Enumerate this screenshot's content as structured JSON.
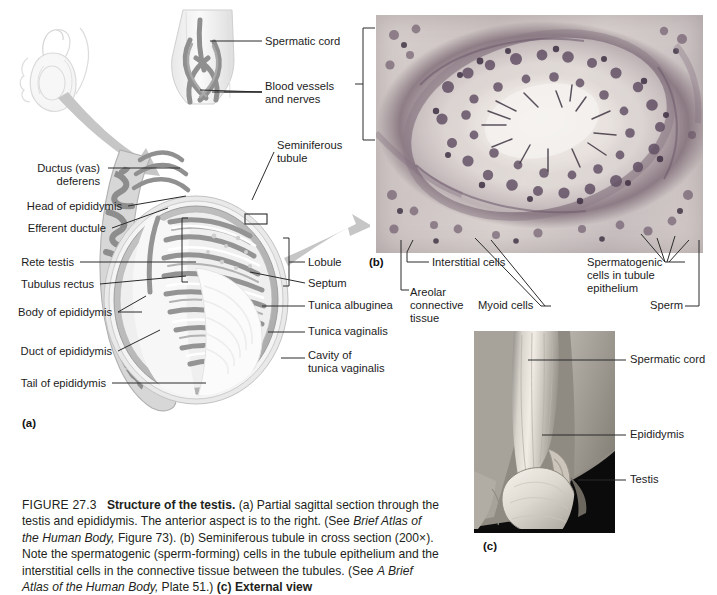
{
  "figure": {
    "number": "FIGURE 27.3",
    "title": "Structure of the testis.",
    "caption_a": "(a) Partial sagittal section through the testis and epididymis. The anterior aspect is to the right. (See",
    "caption_a_ital": "Brief Atlas of the Human Body,",
    "caption_a_tail": " Figure 73).",
    "caption_b": "(b) Seminiferous tubule in cross section (200×). Note the spermatogenic (sperm-forming) cells in the tubule epithelium and the interstitial cells in the connective tissue between the tubules. (See ",
    "caption_b_ital": "A Brief Atlas of the Human Body,",
    "caption_b_tail": " Plate 51.)",
    "caption_c": "(c) External view",
    "panel_a_tag": "(a)",
    "panel_b_tag": "(b)",
    "panel_c_tag": "(c)"
  },
  "panel_a": {
    "labels_left": [
      {
        "text": "Ductus (vas)\ndeferens",
        "x": 8,
        "y": 168
      },
      {
        "text": "Head of epididymis",
        "x": 8,
        "y": 206
      },
      {
        "text": "Efferent ductule",
        "x": 8,
        "y": 228
      },
      {
        "text": "Rete testis",
        "x": 8,
        "y": 262
      },
      {
        "text": "Tubulus rectus",
        "x": 8,
        "y": 284
      },
      {
        "text": "Body of epididymis",
        "x": 8,
        "y": 312
      },
      {
        "text": "Duct of epididymis",
        "x": 8,
        "y": 351
      },
      {
        "text": "Tail of epididymis",
        "x": 8,
        "y": 382
      }
    ],
    "labels_right": [
      {
        "text": "Spermatic cord",
        "x": 265,
        "y": 41
      },
      {
        "text": "Blood vessels\nand nerves",
        "x": 265,
        "y": 87
      },
      {
        "text": "Seminiferous\ntubule",
        "x": 277,
        "y": 145
      },
      {
        "text": "Lobule",
        "x": 308,
        "y": 262
      },
      {
        "text": "Septum",
        "x": 308,
        "y": 283
      },
      {
        "text": "Tunica albuginea",
        "x": 308,
        "y": 305
      },
      {
        "text": "Tunica vaginalis",
        "x": 308,
        "y": 331
      },
      {
        "text": "Cavity of\ntunica vaginalis",
        "x": 308,
        "y": 355
      }
    ]
  },
  "panel_b": {
    "labels": [
      {
        "text": "Interstitial cells",
        "x": 432,
        "y": 262
      },
      {
        "text": "Areolar\nconnective\ntissue",
        "x": 407,
        "y": 292
      },
      {
        "text": "Myoid cells",
        "x": 479,
        "y": 304
      },
      {
        "text": "Spermatogenic\ncells in tubule\nepithelium",
        "x": 588,
        "y": 261
      },
      {
        "text": "Sperm",
        "x": 651,
        "y": 304
      }
    ]
  },
  "panel_c": {
    "labels": [
      {
        "text": "Spermatic cord",
        "x": 630,
        "y": 359
      },
      {
        "text": "Epididymis",
        "x": 630,
        "y": 434
      },
      {
        "text": "Testis",
        "x": 630,
        "y": 479
      }
    ]
  },
  "colors": {
    "ink": "#1c1c1c",
    "leader": "#2b2b2b",
    "tissue_gray": "#9b9b9b",
    "tissue_light": "#cfcfcf",
    "capsule": "#b8b8b8",
    "arrow_gray": "#bdbdbd",
    "stain_purple": "#6d5a70",
    "photo_black": "#0a0a0a"
  }
}
